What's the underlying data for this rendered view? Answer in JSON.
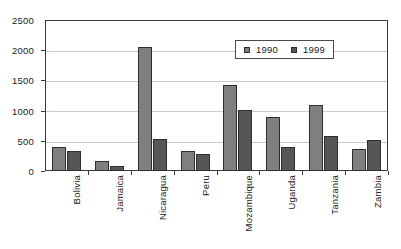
{
  "chart_data": {
    "type": "bar",
    "title": "",
    "subtitle": "",
    "xlabel": "",
    "ylabel": "",
    "ylim": [
      0,
      2500
    ],
    "yticks": [
      0,
      500,
      1000,
      1500,
      2000,
      2500
    ],
    "grid": true,
    "legend_position": "top-right",
    "categories": [
      "Bolivia",
      "Jamaica",
      "Nicaragua",
      "Peru",
      "Mozambique",
      "Uganda",
      "Tanzania",
      "Zambia"
    ],
    "series": [
      {
        "name": "1990",
        "color": "#7f7f7f",
        "values": [
          390,
          165,
          2060,
          330,
          1420,
          895,
          1090,
          360
        ]
      },
      {
        "name": "1999",
        "color": "#565656",
        "values": [
          325,
          80,
          525,
          280,
          1015,
          405,
          575,
          510
        ]
      }
    ]
  },
  "legend": {
    "entries": [
      {
        "label": "1990",
        "swatch": "legend-swatch-1990"
      },
      {
        "label": "1999",
        "swatch": "legend-swatch-1999"
      }
    ]
  },
  "axes": {
    "y_tick_labels": [
      "2500",
      "2000",
      "1500",
      "1000",
      "500",
      "0"
    ],
    "x_tick_labels": [
      "Bolivia",
      "Jamaica",
      "Nicaragua",
      "Peru",
      "Mozambique",
      "Uganda",
      "Tanzania",
      "Zambia"
    ]
  },
  "colors": {
    "series_1990": "#7f7f7f",
    "series_1999": "#565656",
    "frame": "#3a3a3a",
    "gridline": "#c9c9c9",
    "background": "#ffffff",
    "text": "#1a1a1a"
  }
}
